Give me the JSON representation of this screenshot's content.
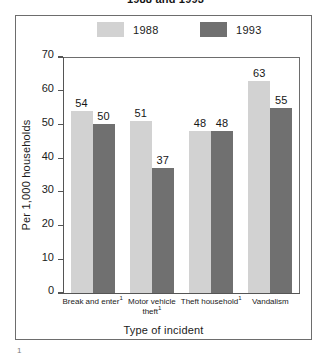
{
  "figure": {
    "title": "1988 and 1993",
    "footnote_marker": "1"
  },
  "chart_data": {
    "type": "bar",
    "title": "1988 and 1993",
    "xlabel": "Type of incident",
    "ylabel": "Per 1,000 households",
    "categories": [
      "Break and enter",
      "Motor vehicle theft",
      "Theft household",
      "Vandalism"
    ],
    "category_footnotes": [
      "1",
      "1",
      "1",
      ""
    ],
    "series": [
      {
        "name": "1988",
        "color": "#d2d2d2",
        "values": [
          54,
          51,
          48,
          63
        ]
      },
      {
        "name": "1993",
        "color": "#707070",
        "values": [
          50,
          37,
          48,
          55
        ]
      }
    ],
    "ylim": [
      0,
      70
    ],
    "yticks": [
      0,
      10,
      20,
      30,
      40,
      50,
      60,
      70
    ],
    "ytick_labels": [
      "0",
      "10",
      "20",
      "30",
      "40",
      "50",
      "60",
      "70"
    ],
    "grid": false,
    "legend_position": "top",
    "bar_labels_shown": true
  }
}
